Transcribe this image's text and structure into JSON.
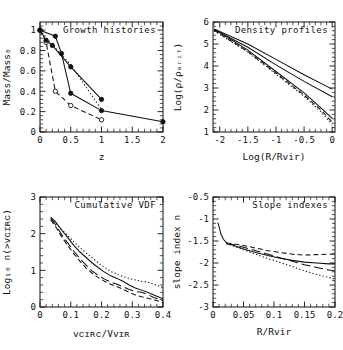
{
  "figure": {
    "background": "#ffffff",
    "foreground": "#111111",
    "panel_count": 4
  },
  "chart_data": [
    {
      "type": "line",
      "panel": "top-left",
      "title": "Growth histories",
      "xlabel": "z",
      "ylabel": "Mass/Mass₀",
      "xlim": [
        0,
        2
      ],
      "ylim": [
        0,
        1.08
      ],
      "xticks": [
        0,
        0.5,
        1,
        1.5,
        2
      ],
      "xticklabels": [
        "0",
        "0.5",
        "1",
        "1.5",
        "2"
      ],
      "yticks": [
        0,
        0.2,
        0.4,
        0.6,
        0.8,
        1
      ],
      "yticklabels": [
        "0",
        "0.2",
        "0.4",
        "0.6",
        "0.8",
        "1"
      ],
      "grid": false,
      "legend": "none",
      "series": [
        {
          "name": "halo-A-solid",
          "style": "solid",
          "marker": "filled-circle",
          "x": [
            0,
            0.25,
            0.35,
            0.5,
            1,
            2
          ],
          "y": [
            1.0,
            0.94,
            0.77,
            0.38,
            0.21,
            0.1
          ]
        },
        {
          "name": "halo-B-dashed",
          "style": "dashed",
          "marker": "open-circle",
          "x": [
            0,
            0.1,
            0.25,
            0.5,
            1
          ],
          "y": [
            1.0,
            0.88,
            0.4,
            0.26,
            0.12
          ]
        },
        {
          "name": "halo-C-solid-filled",
          "style": "solid",
          "marker": "filled-circle",
          "x": [
            0,
            0.1,
            0.2,
            0.5,
            1
          ],
          "y": [
            1.0,
            0.9,
            0.85,
            0.64,
            0.32
          ]
        },
        {
          "name": "halo-D-dotted",
          "style": "dotted",
          "marker": "none",
          "x": [
            0,
            0.2,
            0.5,
            1
          ],
          "y": [
            1.0,
            0.86,
            0.66,
            0.22
          ]
        }
      ]
    },
    {
      "type": "line",
      "panel": "top-right",
      "title": "Density profiles",
      "xlabel": "Log(R/Rvir)",
      "ylabel": "Log(ρ/ρₑᵣᵢₜ)",
      "xlim": [
        -2.12,
        0.05
      ],
      "ylim": [
        1,
        6
      ],
      "xticks": [
        -2,
        -1.5,
        -1,
        -0.5,
        0
      ],
      "xticklabels": [
        "-2",
        "-1.5",
        "-1",
        "-0.5",
        "0"
      ],
      "yticks": [
        1,
        2,
        3,
        4,
        5,
        6
      ],
      "yticklabels": [
        "1",
        "2",
        "3",
        "4",
        "5",
        "6"
      ],
      "grid": false,
      "legend": "none",
      "series": [
        {
          "name": "profile-shallow-solid",
          "style": "solid",
          "x": [
            -2.1,
            -1.5,
            -1.0,
            -0.5,
            0.0
          ],
          "y": [
            5.68,
            5.0,
            4.3,
            3.6,
            2.95
          ]
        },
        {
          "name": "profile-mid-solid",
          "style": "solid",
          "x": [
            -2.1,
            -1.5,
            -1.0,
            -0.5,
            0.0
          ],
          "y": [
            5.66,
            4.85,
            4.05,
            3.3,
            2.6
          ]
        },
        {
          "name": "profile-steep-solid",
          "style": "solid",
          "x": [
            -2.1,
            -1.5,
            -1.0,
            -0.5,
            -0.2,
            0.0
          ],
          "y": [
            5.68,
            4.72,
            3.75,
            2.78,
            2.1,
            1.62
          ]
        },
        {
          "name": "profile-steep-dashed",
          "style": "dashed",
          "x": [
            -2.1,
            -1.5,
            -1.0,
            -0.5,
            -0.2,
            0.0
          ],
          "y": [
            5.62,
            4.66,
            3.68,
            2.68,
            2.0,
            1.45
          ]
        },
        {
          "name": "profile-steep-dotted",
          "style": "dotted",
          "x": [
            -2.1,
            -1.5,
            -1.0,
            -0.5,
            -0.2,
            0.0
          ],
          "y": [
            5.6,
            4.63,
            3.63,
            2.62,
            1.92,
            1.35
          ]
        }
      ]
    },
    {
      "type": "line",
      "panel": "bottom-left",
      "title": "Cumulative VDF",
      "xlabel": "vᴄɪʀᴄ/Vᴠɪʀ",
      "ylabel": "Log₁₀ n(>vᴄɪʀᴄ)",
      "xlim": [
        0,
        0.4
      ],
      "ylim": [
        0,
        3
      ],
      "xticks": [
        0,
        0.1,
        0.2,
        0.3,
        0.4
      ],
      "xticklabels": [
        "0",
        "0.1",
        "0.2",
        "0.3",
        "0.4"
      ],
      "yticks": [
        0,
        1,
        2,
        3
      ],
      "yticklabels": [
        "0",
        "1",
        "2",
        "3"
      ],
      "grid": false,
      "legend": "none",
      "series": [
        {
          "name": "vdf-solid",
          "style": "solid",
          "x": [
            0.035,
            0.05,
            0.07,
            0.09,
            0.11,
            0.13,
            0.15,
            0.17,
            0.19,
            0.21,
            0.23,
            0.25,
            0.27,
            0.29,
            0.31,
            0.33,
            0.35,
            0.37,
            0.39,
            0.4
          ],
          "y": [
            2.45,
            2.33,
            2.1,
            1.9,
            1.68,
            1.5,
            1.35,
            1.2,
            1.07,
            0.95,
            0.85,
            0.78,
            0.7,
            0.6,
            0.52,
            0.46,
            0.4,
            0.33,
            0.26,
            0.22
          ]
        },
        {
          "name": "vdf-long-dashed",
          "style": "long-dashed",
          "x": [
            0.035,
            0.05,
            0.07,
            0.09,
            0.11,
            0.13,
            0.15,
            0.17,
            0.19,
            0.21,
            0.23,
            0.25,
            0.27,
            0.29,
            0.31,
            0.33,
            0.35,
            0.37,
            0.39,
            0.4
          ],
          "y": [
            2.42,
            2.25,
            1.98,
            1.75,
            1.52,
            1.32,
            1.14,
            0.98,
            0.86,
            0.76,
            0.68,
            0.62,
            0.55,
            0.48,
            0.42,
            0.4,
            0.34,
            0.26,
            0.2,
            0.17
          ]
        },
        {
          "name": "vdf-dashed",
          "style": "dashed",
          "x": [
            0.035,
            0.05,
            0.07,
            0.09,
            0.11,
            0.13,
            0.15,
            0.17,
            0.19,
            0.21,
            0.23,
            0.25,
            0.27,
            0.29,
            0.31,
            0.33,
            0.35,
            0.37,
            0.39,
            0.4
          ],
          "y": [
            2.38,
            2.2,
            1.92,
            1.68,
            1.45,
            1.25,
            1.06,
            0.92,
            0.8,
            0.7,
            0.62,
            0.56,
            0.48,
            0.4,
            0.33,
            0.28,
            0.24,
            0.2,
            0.15,
            0.12
          ]
        },
        {
          "name": "vdf-dotted",
          "style": "dotted",
          "x": [
            0.035,
            0.05,
            0.07,
            0.09,
            0.11,
            0.13,
            0.15,
            0.17,
            0.19,
            0.21,
            0.23,
            0.25,
            0.27,
            0.29,
            0.31,
            0.33,
            0.35,
            0.37,
            0.39,
            0.4
          ],
          "y": [
            2.4,
            2.3,
            2.12,
            1.95,
            1.78,
            1.62,
            1.47,
            1.34,
            1.2,
            1.08,
            0.97,
            0.9,
            0.83,
            0.78,
            0.74,
            0.7,
            0.68,
            0.62,
            0.56,
            0.52
          ]
        }
      ]
    },
    {
      "type": "line",
      "panel": "bottom-right",
      "title": "Slope indexes",
      "xlabel": "R/Rvir",
      "ylabel": "slope index n",
      "xlim": [
        0,
        0.2
      ],
      "ylim": [
        -3,
        -0.5
      ],
      "xticks": [
        0,
        0.05,
        0.1,
        0.15,
        0.2
      ],
      "xticklabels": [
        "0",
        "0.05",
        "0.1",
        "0.15",
        "0.2"
      ],
      "yticks": [
        -3,
        -2.5,
        -2,
        -1.5,
        -1,
        -0.5
      ],
      "yticklabels": [
        "-3",
        "-2.5",
        "-2",
        "-1.5",
        "-1",
        "-0.5"
      ],
      "grid": false,
      "legend": "none",
      "series": [
        {
          "name": "slope-solid",
          "style": "solid",
          "x": [
            0.008,
            0.01,
            0.013,
            0.017,
            0.022,
            0.03,
            0.04,
            0.05,
            0.07,
            0.09,
            0.11,
            0.13,
            0.15,
            0.17,
            0.19,
            0.2
          ],
          "y": [
            -1.08,
            -1.18,
            -1.34,
            -1.46,
            -1.54,
            -1.58,
            -1.63,
            -1.68,
            -1.76,
            -1.83,
            -1.89,
            -1.94,
            -1.98,
            -2.0,
            -2.02,
            -2.02
          ]
        },
        {
          "name": "slope-dashed",
          "style": "dashed",
          "x": [
            0.022,
            0.03,
            0.04,
            0.05,
            0.07,
            0.09,
            0.11,
            0.13,
            0.15,
            0.17,
            0.19,
            0.2
          ],
          "y": [
            -1.55,
            -1.56,
            -1.58,
            -1.6,
            -1.66,
            -1.72,
            -1.76,
            -1.8,
            -1.82,
            -1.81,
            -1.8,
            -1.79
          ]
        },
        {
          "name": "slope-long-dashed",
          "style": "long-dashed",
          "x": [
            0.022,
            0.03,
            0.04,
            0.05,
            0.07,
            0.09,
            0.11,
            0.13,
            0.15,
            0.17,
            0.19,
            0.2
          ],
          "y": [
            -1.56,
            -1.58,
            -1.6,
            -1.64,
            -1.72,
            -1.8,
            -1.88,
            -1.96,
            -2.04,
            -2.1,
            -2.16,
            -2.18
          ]
        },
        {
          "name": "slope-dotted",
          "style": "dotted",
          "x": [
            0.022,
            0.03,
            0.04,
            0.05,
            0.07,
            0.09,
            0.11,
            0.13,
            0.15,
            0.17,
            0.19,
            0.2
          ],
          "y": [
            -1.56,
            -1.6,
            -1.65,
            -1.7,
            -1.8,
            -1.9,
            -1.99,
            -2.08,
            -2.18,
            -2.26,
            -2.33,
            -2.36
          ]
        }
      ]
    }
  ]
}
